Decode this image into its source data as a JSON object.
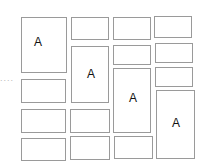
{
  "ellipsis": "....",
  "boxes": [
    {
      "x": 21,
      "y": 17,
      "w": 46,
      "h": 56,
      "label": "A",
      "lx": 12,
      "ly": 17
    },
    {
      "x": 21,
      "y": 79,
      "w": 45,
      "h": 24,
      "label": ""
    },
    {
      "x": 21,
      "y": 109,
      "w": 45,
      "h": 24,
      "label": ""
    },
    {
      "x": 21,
      "y": 138,
      "w": 45,
      "h": 23,
      "label": ""
    },
    {
      "x": 71,
      "y": 17,
      "w": 38,
      "h": 23,
      "label": ""
    },
    {
      "x": 71,
      "y": 46,
      "w": 38,
      "h": 57,
      "label": "A",
      "lx": 15,
      "ly": 20
    },
    {
      "x": 70,
      "y": 109,
      "w": 40,
      "h": 24,
      "label": ""
    },
    {
      "x": 70,
      "y": 136,
      "w": 40,
      "h": 24,
      "label": ""
    },
    {
      "x": 113,
      "y": 17,
      "w": 38,
      "h": 23,
      "label": ""
    },
    {
      "x": 113,
      "y": 45,
      "w": 38,
      "h": 20,
      "label": ""
    },
    {
      "x": 113,
      "y": 68,
      "w": 38,
      "h": 65,
      "label": "A",
      "lx": 15,
      "ly": 22
    },
    {
      "x": 114,
      "y": 136,
      "w": 39,
      "h": 23,
      "label": ""
    },
    {
      "x": 154,
      "y": 16,
      "w": 38,
      "h": 22,
      "label": ""
    },
    {
      "x": 155,
      "y": 43,
      "w": 38,
      "h": 20,
      "label": ""
    },
    {
      "x": 155,
      "y": 67,
      "w": 38,
      "h": 20,
      "label": ""
    },
    {
      "x": 156,
      "y": 90,
      "w": 39,
      "h": 69,
      "label": "A",
      "lx": 15,
      "ly": 25
    }
  ]
}
